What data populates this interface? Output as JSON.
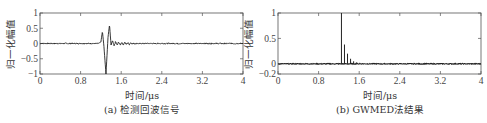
{
  "chart_data": [
    {
      "type": "line",
      "id": "a",
      "caption": "(a) 检测回波信号",
      "xlabel": "时间/μs",
      "ylabel": "归一化幅值",
      "xlim": [
        0,
        4
      ],
      "ylim": [
        -1,
        1
      ],
      "xticks": [
        0,
        0.8,
        1.6,
        2.4,
        3.2,
        4
      ],
      "xtick_labels": [
        "0",
        "0.8",
        "1.6",
        "2.4",
        "3.2",
        "4"
      ],
      "yticks": [
        -1,
        -0.5,
        0,
        0.5,
        1
      ],
      "ytick_labels": [
        "−1",
        "−0.5",
        "0",
        "0.5",
        "1"
      ],
      "grid": false,
      "series": [
        {
          "name": "echo",
          "color": "#222222",
          "x": [
            0,
            1.15,
            1.2,
            1.23,
            1.26,
            1.3,
            1.34,
            1.37,
            1.4,
            1.43,
            1.46,
            1.49,
            1.52,
            1.55,
            1.58,
            1.61,
            1.64,
            1.67,
            1.7,
            1.73,
            1.76,
            1.79,
            1.82,
            1.85,
            1.88,
            1.91,
            1.94,
            2.0,
            4
          ],
          "y": [
            0,
            0,
            0.05,
            0.4,
            -0.1,
            -1.0,
            0.2,
            0.62,
            -0.05,
            0.1,
            -0.08,
            0.06,
            -0.06,
            0.05,
            -0.05,
            0.04,
            -0.04,
            0.04,
            -0.03,
            0.03,
            -0.03,
            0.03,
            -0.02,
            0.02,
            -0.02,
            0.02,
            -0.01,
            0,
            0
          ]
        }
      ],
      "noise_amplitude": 0.02
    },
    {
      "type": "line",
      "id": "b",
      "caption": "(b) GWMED法结果",
      "xlabel": "时间/μs",
      "ylabel": "归一化幅值",
      "xlim": [
        0,
        4
      ],
      "ylim": [
        -0.2,
        1
      ],
      "xticks": [
        0,
        0.8,
        1.6,
        2.4,
        3.2,
        4
      ],
      "xtick_labels": [
        "0",
        "0.8",
        "1.6",
        "2.4",
        "3.2",
        "4"
      ],
      "yticks": [
        -0.2,
        0,
        0.5,
        1
      ],
      "ytick_labels": [
        "−0.2",
        "0",
        "0.5",
        "1"
      ],
      "grid": false,
      "series": [
        {
          "name": "GWMED",
          "color": "#222222",
          "spikes_x": [
            1.25,
            1.31,
            1.37,
            1.43,
            1.49,
            1.55,
            1.61,
            1.67
          ],
          "spikes_y": [
            1.0,
            0.38,
            0.2,
            0.1,
            0.05,
            0.03,
            0.02,
            0.01
          ]
        }
      ],
      "noise_amplitude": 0.008
    }
  ]
}
